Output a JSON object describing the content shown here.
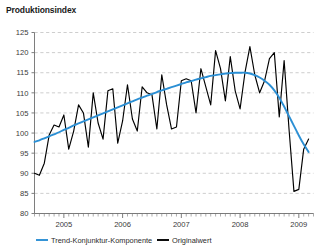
{
  "chart_title": "Produktionsindex",
  "legend": {
    "position": "bottom-left",
    "items": [
      {
        "label": "Trend-Konjunktur-Komponente",
        "color": "#2b8fd4",
        "key": "trend"
      },
      {
        "label": "Originalwert",
        "color": "#000000",
        "key": "original"
      }
    ]
  },
  "chart_data": {
    "type": "line",
    "title": "Produktionsindex",
    "subtitle": "",
    "xlabel": "",
    "ylabel": "",
    "ylim": [
      80,
      125
    ],
    "ytick_step": 5,
    "ytick_labels": [
      "125",
      "120",
      "115",
      "110",
      "105",
      "100",
      "95",
      "90",
      "85",
      "80"
    ],
    "ytick_values": [
      125,
      120,
      115,
      110,
      105,
      100,
      95,
      90,
      85,
      80
    ],
    "xtick_labels": [
      "2005",
      "2006",
      "2007",
      "2008",
      "2009"
    ],
    "xtick_values": [
      2005,
      2006,
      2007,
      2008,
      2009
    ],
    "xlim": [
      2004.5,
      2009.25
    ],
    "x_minor_ticks": "monthly",
    "grid": "horizontal-dashed",
    "legend_position": "bottom-left",
    "x": [
      2004.5,
      2004.583,
      2004.667,
      2004.75,
      2004.833,
      2004.917,
      2005.0,
      2005.083,
      2005.167,
      2005.25,
      2005.333,
      2005.417,
      2005.5,
      2005.583,
      2005.667,
      2005.75,
      2005.833,
      2005.917,
      2006.0,
      2006.083,
      2006.167,
      2006.25,
      2006.333,
      2006.417,
      2006.5,
      2006.583,
      2006.667,
      2006.75,
      2006.833,
      2006.917,
      2007.0,
      2007.083,
      2007.167,
      2007.25,
      2007.333,
      2007.417,
      2007.5,
      2007.583,
      2007.667,
      2007.75,
      2007.833,
      2007.917,
      2008.0,
      2008.083,
      2008.167,
      2008.25,
      2008.333,
      2008.417,
      2008.5,
      2008.583,
      2008.667,
      2008.75,
      2008.833,
      2008.917,
      2009.0,
      2009.083,
      2009.167
    ],
    "series": [
      {
        "name": "Originalwert",
        "key": "original",
        "color": "#000000",
        "values": [
          90.0,
          89.5,
          92.5,
          99.5,
          102.0,
          101.5,
          104.5,
          96.0,
          100.5,
          107.0,
          105.0,
          96.5,
          110.0,
          102.5,
          98.5,
          110.5,
          111.0,
          97.5,
          103.0,
          112.0,
          103.5,
          100.5,
          111.5,
          110.0,
          109.5,
          101.0,
          114.5,
          107.0,
          101.0,
          101.5,
          113.0,
          113.5,
          113.0,
          105.0,
          116.0,
          111.5,
          107.0,
          120.5,
          116.0,
          108.0,
          119.0,
          110.5,
          106.0,
          115.0,
          121.5,
          114.5,
          110.0,
          113.0,
          118.5,
          120.0,
          104.0,
          118.0,
          101.0,
          85.5,
          86.0,
          96.0,
          98.5
        ]
      },
      {
        "name": "Trend-Konjunktur-Komponente",
        "key": "trend",
        "color": "#2b8fd4",
        "values": [
          97.8,
          98.2,
          98.7,
          99.2,
          99.7,
          100.2,
          100.8,
          101.3,
          101.9,
          102.4,
          102.9,
          103.4,
          103.9,
          104.4,
          104.9,
          105.4,
          105.9,
          106.4,
          106.9,
          107.4,
          107.9,
          108.4,
          108.8,
          109.3,
          109.7,
          110.2,
          110.6,
          111.0,
          111.4,
          111.8,
          112.2,
          112.6,
          112.9,
          113.3,
          113.6,
          113.9,
          114.2,
          114.4,
          114.6,
          114.8,
          114.9,
          115.0,
          115.0,
          115.0,
          114.8,
          114.4,
          113.8,
          113.0,
          112.0,
          110.6,
          108.8,
          106.6,
          104.2,
          101.8,
          99.4,
          97.2,
          95.3
        ]
      }
    ]
  }
}
